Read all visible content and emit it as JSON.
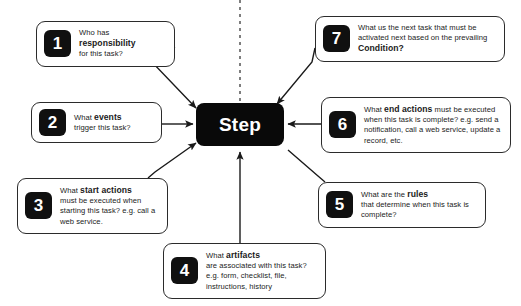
{
  "diagram": {
    "title": "Step",
    "center": {
      "label": "Step",
      "color": "#090909",
      "text_color": "#ffffff"
    },
    "background_color": "#ffffff",
    "line_color": "#2b2b2b",
    "badge_color": "#101010",
    "callouts": [
      {
        "number": "1",
        "line1": "Who has",
        "line2": "responsibility",
        "line3": "for this task?"
      },
      {
        "number": "2",
        "line1": "What ",
        "line2": "events",
        "line3": "trigger this task?"
      },
      {
        "number": "3",
        "line1": "What ",
        "line2": "start actions",
        "line3": "must be executed when starting this task? e.g. call a web service."
      },
      {
        "number": "4",
        "line1": "What ",
        "line2": "artifacts",
        "line3": "are associated with this task? e.g. form, checklist, file, instructions, history"
      },
      {
        "number": "5",
        "line1": "What are the ",
        "line2": "rules",
        "line3": "that determine when this task is complete?"
      },
      {
        "number": "6",
        "line1": "What ",
        "line2": "end actions",
        "line3": " must be executed when this task is complete? e.g. send a notification, call a web service, update a record, etc."
      },
      {
        "number": "7",
        "line1": "What us the next task that must be activated next based on the prevailing ",
        "line2": "Condition?",
        "line3": ""
      }
    ]
  }
}
